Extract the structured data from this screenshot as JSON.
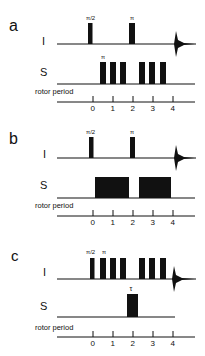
{
  "figure": {
    "panels": [
      {
        "letter": "a",
        "channel_i_label": "I",
        "channel_s_label": "S",
        "rotor_label": "rotor period",
        "i_pulse_labels": [
          "π/2",
          "π"
        ],
        "s_pulse_labels": [
          "π"
        ],
        "tick_labels": [
          "0",
          "1",
          "2",
          "3",
          "4"
        ]
      },
      {
        "letter": "b",
        "channel_i_label": "I",
        "channel_s_label": "S",
        "rotor_label": "rotor period",
        "i_pulse_labels": [
          "π/2",
          "π"
        ],
        "s_pulse_labels": [],
        "tick_labels": [
          "0",
          "1",
          "2",
          "3",
          "4"
        ]
      },
      {
        "letter": "c",
        "channel_i_label": "I",
        "channel_s_label": "S",
        "rotor_label": "rotor period",
        "i_pulse_labels": [
          "π/2",
          "π"
        ],
        "s_pulse_labels": [
          "τ"
        ],
        "tick_labels": [
          "0",
          "1",
          "2",
          "3",
          "4"
        ]
      }
    ]
  }
}
